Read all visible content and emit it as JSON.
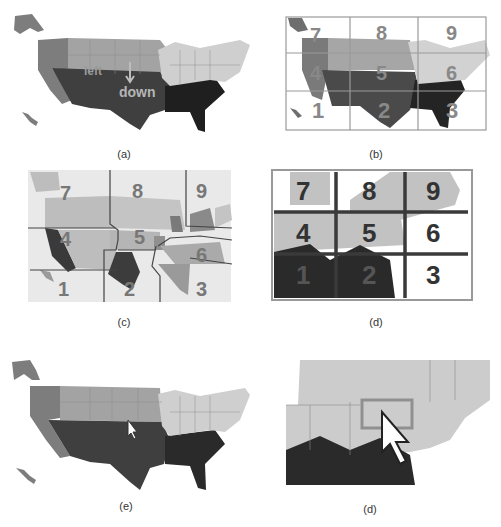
{
  "figure": {
    "panels": [
      {
        "id": "a",
        "caption": "(a)",
        "description": "US map colored by region with direction gesture labels",
        "labels": {
          "left": "left",
          "down": "down",
          "right": "right"
        },
        "colors": {
          "west": "#7d7d7d",
          "plains": "#a0a0a0",
          "south": "#3c3c3c",
          "southeast": "#1e1e1e",
          "northeast": "#cfcfcf"
        }
      },
      {
        "id": "b",
        "caption": "(b)",
        "description": "US map overlaid with 3x3 numeric keypad grid",
        "grid_numbers": [
          "7",
          "8",
          "9",
          "4",
          "5",
          "6",
          "1",
          "2",
          "3"
        ]
      },
      {
        "id": "c",
        "caption": "(c)",
        "description": "US map partitioned into irregular 9 keypad regions",
        "grid_numbers": [
          "7",
          "8",
          "9",
          "4",
          "5",
          "6",
          "1",
          "2",
          "3"
        ]
      },
      {
        "id": "d",
        "caption": "(d)",
        "description": "Zoomed northeast map with 3x3 keypad grid overlay",
        "grid_numbers": [
          "7",
          "8",
          "9",
          "4",
          "5",
          "6",
          "1",
          "2",
          "3"
        ]
      },
      {
        "id": "e",
        "caption": "(e)",
        "description": "US map with mouse cursor pointing at central state"
      },
      {
        "id": "f",
        "caption": "(d)",
        "description": "Zoomed northeast map with cursor over highlighted state"
      }
    ]
  }
}
